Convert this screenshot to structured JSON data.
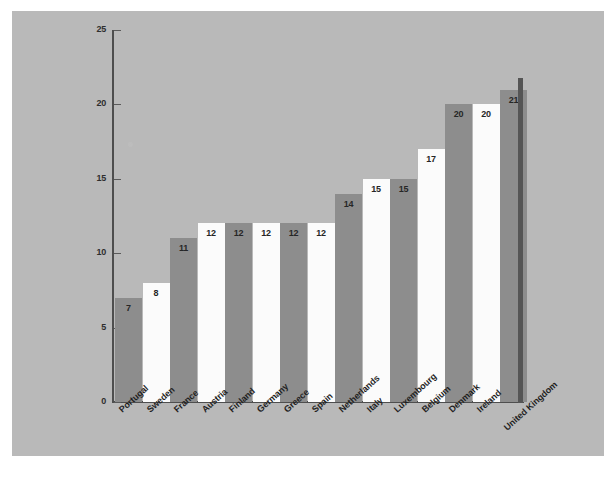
{
  "chart_data": {
    "type": "bar",
    "title": "",
    "subtitle": "",
    "xlabel": "",
    "ylabel": "",
    "ylim": [
      0,
      25
    ],
    "y_ticks": [
      "0",
      "5",
      "10",
      "15",
      "20",
      "25"
    ],
    "grid": false,
    "legend": "none",
    "categories": [
      "Portugal",
      "Sweden",
      "France",
      "Austria",
      "Finland",
      "Germany",
      "Greece",
      "Spain",
      "Netherlands",
      "Italy",
      "Luxembourg",
      "Belgium",
      "Denmark",
      "Ireland",
      "United Kingdom"
    ],
    "values": [
      7,
      8,
      11,
      12,
      12,
      12,
      12,
      12,
      14,
      15,
      15,
      17,
      20,
      20,
      21
    ],
    "bar_fills": [
      "gray",
      "white",
      "gray",
      "white",
      "gray",
      "white",
      "gray",
      "white",
      "gray",
      "white",
      "gray",
      "white",
      "gray",
      "white",
      "gray"
    ],
    "colors": {
      "panel_background": "#b9b9b9",
      "bar_gray": "#8d8d8d",
      "bar_white": "#fbfbfb",
      "axis": "#4e4e4e",
      "text": "#1f1f1f",
      "page_background": "#ffffff",
      "shadow": "#555555"
    }
  }
}
